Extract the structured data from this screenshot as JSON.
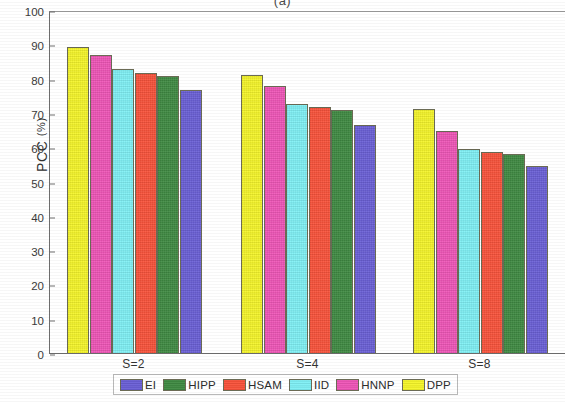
{
  "figure": {
    "title": "(a)",
    "ylabel_main": "PCC",
    "ylabel_unit": "(%)"
  },
  "chart_data": {
    "type": "bar",
    "title": "(a)",
    "xlabel": "",
    "ylabel": "PCC (%)",
    "ylim": [
      0,
      100
    ],
    "ytick_step": 10,
    "ytick_labels": [
      "0",
      "10",
      "20",
      "30",
      "40",
      "50",
      "60",
      "70",
      "80",
      "90",
      "100"
    ],
    "grid": false,
    "legend_position": "bottom",
    "categories": [
      "S=2",
      "S=4",
      "S=8"
    ],
    "series": [
      {
        "name": "DPP",
        "color": "#f5f529",
        "values": [
          89.5,
          81.2,
          71.3
        ]
      },
      {
        "name": "HNNP",
        "color": "#ef55b7",
        "values": [
          87.2,
          78.0,
          65.0
        ]
      },
      {
        "name": "IID",
        "color": "#7ff0f5",
        "values": [
          83.0,
          73.0,
          59.7
        ]
      },
      {
        "name": "HSAM",
        "color": "#f9523a",
        "values": [
          81.8,
          72.0,
          58.8
        ]
      },
      {
        "name": "HIPP",
        "color": "#3f8a42",
        "values": [
          81.0,
          71.0,
          58.2
        ]
      },
      {
        "name": "EI",
        "color": "#6a5fd6",
        "values": [
          77.0,
          66.8,
          54.8
        ]
      }
    ],
    "legend_order": [
      "EI",
      "HIPP",
      "HSAM",
      "IID",
      "HNNP",
      "DPP"
    ]
  },
  "legend": {
    "items": [
      {
        "label": "EI",
        "color": "#6a5fd6"
      },
      {
        "label": "HIPP",
        "color": "#3f8a42"
      },
      {
        "label": "HSAM",
        "color": "#f9523a"
      },
      {
        "label": "IID",
        "color": "#7ff0f5"
      },
      {
        "label": "HNNP",
        "color": "#ef55b7"
      },
      {
        "label": "DPP",
        "color": "#f5f529"
      }
    ]
  }
}
